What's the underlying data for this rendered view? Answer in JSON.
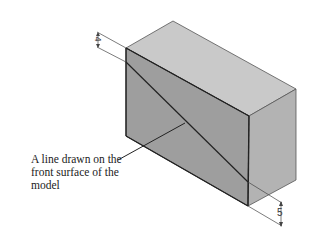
{
  "figure": {
    "caption": {
      "line1": "A line drawn on the",
      "line2": "front surface of the",
      "line3": "model"
    },
    "dimensions": {
      "top_left": "4",
      "bottom_right": "5"
    },
    "colors": {
      "top_face": "#c9c9c9",
      "front_face": "#9e9e9e",
      "right_face": "#b3b3b3",
      "edge": "#333333",
      "drawn_line": "#222222"
    }
  }
}
